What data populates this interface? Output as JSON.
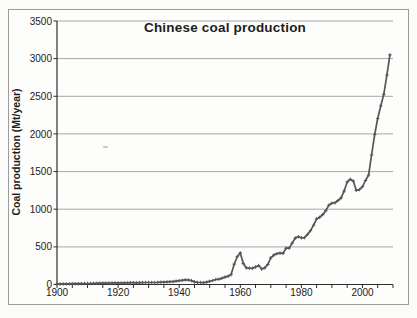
{
  "chart_data": {
    "type": "line",
    "title": "Chinese coal production",
    "xlabel": "",
    "ylabel": "Coal production (Mt/year)",
    "xlim": [
      1900,
      2010
    ],
    "ylim": [
      0,
      3500
    ],
    "x_tick_labels": [
      "1900",
      "1920",
      "1940",
      "1960",
      "1980",
      "2000"
    ],
    "x_tick_years": [
      1900,
      1920,
      1940,
      1960,
      1980,
      2000
    ],
    "x_minor_tick_step_years": 5,
    "y_tick_labels": [
      "0",
      "500",
      "1000",
      "1500",
      "2000",
      "2500",
      "3000",
      "3500"
    ],
    "y_tick_values": [
      0,
      500,
      1000,
      1500,
      2000,
      2500,
      3000,
      3500
    ],
    "grid": "horizontal",
    "legend": "none",
    "line_color": "#575757",
    "marker": "plus",
    "series": [
      {
        "name": "Chinese coal production (Mt/year)",
        "x": [
          1900,
          1901,
          1902,
          1903,
          1904,
          1905,
          1906,
          1907,
          1908,
          1909,
          1910,
          1911,
          1912,
          1913,
          1914,
          1915,
          1916,
          1917,
          1918,
          1919,
          1920,
          1921,
          1922,
          1923,
          1924,
          1925,
          1926,
          1927,
          1928,
          1929,
          1930,
          1931,
          1932,
          1933,
          1934,
          1935,
          1936,
          1937,
          1938,
          1939,
          1940,
          1941,
          1942,
          1943,
          1944,
          1945,
          1946,
          1947,
          1948,
          1949,
          1950,
          1951,
          1952,
          1953,
          1954,
          1955,
          1956,
          1957,
          1958,
          1959,
          1960,
          1961,
          1962,
          1963,
          1964,
          1965,
          1966,
          1967,
          1968,
          1969,
          1970,
          1971,
          1972,
          1973,
          1974,
          1975,
          1976,
          1977,
          1978,
          1979,
          1980,
          1981,
          1982,
          1983,
          1984,
          1985,
          1986,
          1987,
          1988,
          1989,
          1990,
          1991,
          1992,
          1993,
          1994,
          1995,
          1996,
          1997,
          1998,
          1999,
          2000,
          2001,
          2002,
          2003,
          2004,
          2005,
          2006,
          2007,
          2008,
          2009
        ],
        "y": [
          7,
          7,
          8,
          8,
          9,
          10,
          10,
          11,
          12,
          13,
          13,
          13,
          14,
          16,
          17,
          18,
          19,
          20,
          20,
          21,
          21,
          20,
          21,
          23,
          24,
          24,
          23,
          24,
          25,
          26,
          26,
          27,
          26,
          28,
          30,
          32,
          35,
          37,
          39,
          45,
          50,
          56,
          62,
          60,
          52,
          35,
          28,
          27,
          25,
          32,
          43,
          53,
          66,
          70,
          84,
          98,
          110,
          131,
          270,
          369,
          420,
          278,
          220,
          217,
          215,
          232,
          252,
          206,
          220,
          266,
          354,
          392,
          410,
          417,
          413,
          482,
          483,
          550,
          618,
          635,
          620,
          622,
          666,
          715,
          789,
          872,
          894,
          928,
          980,
          1054,
          1080,
          1087,
          1116,
          1150,
          1240,
          1361,
          1397,
          1373,
          1250,
          1260,
          1299,
          1381,
          1455,
          1722,
          1992,
          2205,
          2373,
          2526,
          2782,
          3050
        ]
      }
    ]
  }
}
